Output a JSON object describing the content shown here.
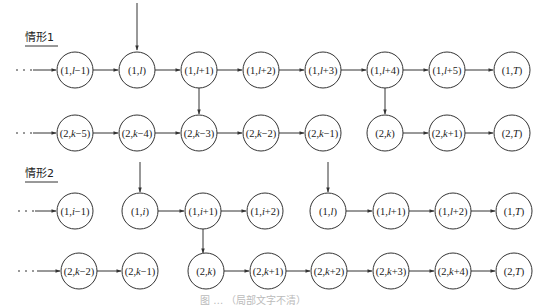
{
  "figure": {
    "type": "state-transition-diagram",
    "caption_fragment": "图 … （局部文字不清）",
    "colors": {
      "stroke": "#333333",
      "text": "#222222",
      "background": "#ffffff"
    }
  },
  "case1": {
    "label": "情形1",
    "row1": [
      {
        "id": "c1r1n0",
        "pre": "(1,",
        "var": "l",
        "post": "−1)",
        "x": 75
      },
      {
        "id": "c1r1n1",
        "pre": "(1,",
        "var": "l",
        "post": ")",
        "x": 137
      },
      {
        "id": "c1r1n2",
        "pre": "(1,",
        "var": "l",
        "post": "+1)",
        "x": 199
      },
      {
        "id": "c1r1n3",
        "pre": "(1,",
        "var": "l",
        "post": "+2)",
        "x": 261
      },
      {
        "id": "c1r1n4",
        "pre": "(1,",
        "var": "l",
        "post": "+3)",
        "x": 323
      },
      {
        "id": "c1r1n5",
        "pre": "(1,",
        "var": "l",
        "post": "+4)",
        "x": 385
      },
      {
        "id": "c1r1n6",
        "pre": "(1,",
        "var": "l",
        "post": "+5)",
        "x": 447
      },
      {
        "id": "c1r1n7",
        "pre": "(1,",
        "var": "T",
        "post": ")",
        "x": 512
      }
    ],
    "row2": [
      {
        "id": "c1r2n0",
        "pre": "(2,",
        "var": "k",
        "post": "−5)",
        "x": 75
      },
      {
        "id": "c1r2n1",
        "pre": "(2,",
        "var": "k",
        "post": "−4)",
        "x": 137
      },
      {
        "id": "c1r2n2",
        "pre": "(2,",
        "var": "k",
        "post": "−3)",
        "x": 199
      },
      {
        "id": "c1r2n3",
        "pre": "(2,",
        "var": "k",
        "post": "−2)",
        "x": 261
      },
      {
        "id": "c1r2n4",
        "pre": "(2,",
        "var": "k",
        "post": "−1)",
        "x": 323
      },
      {
        "id": "c1r2n5",
        "pre": "(2,",
        "var": "k",
        "post": ")",
        "x": 385
      },
      {
        "id": "c1r2n6",
        "pre": "(2,",
        "var": "k",
        "post": "+1)",
        "x": 447
      },
      {
        "id": "c1r2n7",
        "pre": "(2,",
        "var": "T",
        "post": ")",
        "x": 512
      }
    ],
    "edges": [
      "entry→(1,l−1)",
      "(1,l−1)→(1,l)",
      "(1,l)→(1,l+1)",
      "(1,l+1)→(1,l+2)",
      "(1,l+2)→(1,l+3)",
      "(1,l+3)→(1,l+4)",
      "(1,l+4)→(1,l+5)",
      "(1,l+5)→(1,T)",
      "entry→(2,k−5)",
      "(2,k−5)→(2,k−4)",
      "(2,k−4)→(2,k−3)",
      "(2,k−3)→(2,k−2)",
      "(2,k−2)→(2,k−1)",
      "(2,k)→(2,k+1)",
      "(2,k+1)→(2,T)",
      "top→(1,l)",
      "(1,l+1)→(2,k−3)",
      "(1,l+4)→(2,k)"
    ]
  },
  "case2": {
    "label": "情形2",
    "row1": [
      {
        "id": "c2r1n0",
        "pre": "(1,",
        "var": "i",
        "post": "−1)",
        "x": 75
      },
      {
        "id": "c2r1n1",
        "pre": "(1,",
        "var": "i",
        "post": ")",
        "x": 140
      },
      {
        "id": "c2r1n2",
        "pre": "(1,",
        "var": "i",
        "post": "+1)",
        "x": 203
      },
      {
        "id": "c2r1n3",
        "pre": "(1,",
        "var": "i",
        "post": "+2)",
        "x": 265
      },
      {
        "id": "c2r1n4",
        "pre": "(1,",
        "var": "l",
        "post": ")",
        "x": 328
      },
      {
        "id": "c2r1n5",
        "pre": "(1,",
        "var": "l",
        "post": "+1)",
        "x": 391
      },
      {
        "id": "c2r1n6",
        "pre": "(1,",
        "var": "l",
        "post": "+2)",
        "x": 453
      },
      {
        "id": "c2r1n7",
        "pre": "(1,",
        "var": "T",
        "post": ")",
        "x": 514
      }
    ],
    "row2": [
      {
        "id": "c2r2n0",
        "pre": "(2,",
        "var": "k",
        "post": "−2)",
        "x": 79
      },
      {
        "id": "c2r2n1",
        "pre": "(2,",
        "var": "k",
        "post": "−1)",
        "x": 140
      },
      {
        "id": "c2r2n2",
        "pre": "(2,",
        "var": "k",
        "post": ")",
        "x": 206
      },
      {
        "id": "c2r2n3",
        "pre": "(2,",
        "var": "k",
        "post": "+1)",
        "x": 268
      },
      {
        "id": "c2r2n4",
        "pre": "(2,",
        "var": "k",
        "post": "+2)",
        "x": 329
      },
      {
        "id": "c2r2n5",
        "pre": "(2,",
        "var": "k",
        "post": "+3)",
        "x": 391
      },
      {
        "id": "c2r2n6",
        "pre": "(2,",
        "var": "k",
        "post": "+4)",
        "x": 453
      },
      {
        "id": "c2r2n7",
        "pre": "(2,",
        "var": "T",
        "post": ")",
        "x": 514
      }
    ],
    "edges": [
      "entry→(1,i−1)",
      "(1,i)→(1,i+1)",
      "(1,i+1)→(1,i+2)",
      "(1,l)→(1,l+1)",
      "(1,l+1)→(1,l+2)",
      "(1,l+2)→(1,T)",
      "entry→(2,k−2)",
      "(2,k−2)→(2,k−1)",
      "(2,k)→(2,k+1)",
      "(2,k+1)→(2,k+2)",
      "(2,k+2)→(2,k+3)",
      "(2,k+3)→(2,k+4)",
      "(2,k+4)→(2,T)",
      "top→(1,i)",
      "top→(1,l)",
      "(1,i+1)→(2,k)"
    ]
  }
}
